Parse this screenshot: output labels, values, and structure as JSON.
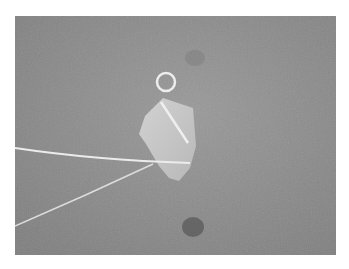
{
  "image": {
    "description": "Wire-wrapped sea glass pendant with a loop bail on a gray textured surface, two wire ends extending to the lower left",
    "colors": {
      "background": "#8a8a8a",
      "glass": "#c9c9c9",
      "wire": "#ececec",
      "border": "#ffffff"
    }
  }
}
